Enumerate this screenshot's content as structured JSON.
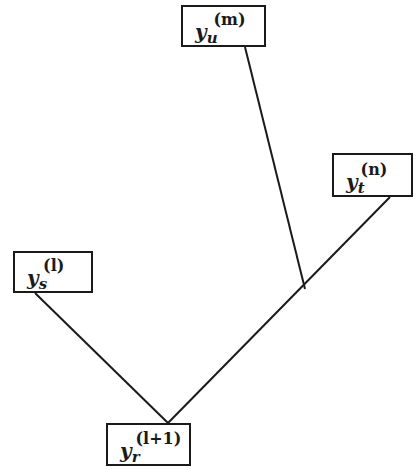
{
  "diagram": {
    "type": "tree",
    "colors": {
      "stroke": "#1a1a1a",
      "background": "#ffffff"
    },
    "nodes": [
      {
        "id": "u",
        "base": "y",
        "sub": "u",
        "sup": "(m)",
        "box": [
          181,
          5,
          85,
          42
        ]
      },
      {
        "id": "t",
        "base": "y",
        "sub": "t",
        "sup": "(n)",
        "box": [
          332,
          153,
          81,
          44
        ]
      },
      {
        "id": "s",
        "base": "y",
        "sub": "s",
        "sup": "(l)",
        "box": [
          13,
          251,
          80,
          42
        ]
      },
      {
        "id": "r",
        "base": "y",
        "sub": "r",
        "sup": "(l+1)",
        "box": [
          106,
          423,
          85,
          43
        ]
      }
    ],
    "edges": [
      {
        "from": "u",
        "to": "junction",
        "points": [
          [
            245,
            47
          ],
          [
            305,
            289
          ]
        ]
      },
      {
        "from": "t",
        "to": "r",
        "points": [
          [
            390,
            197
          ],
          [
            168,
            423
          ]
        ]
      },
      {
        "from": "s",
        "to": "r",
        "points": [
          [
            35,
            293
          ],
          [
            168,
            423
          ]
        ]
      }
    ],
    "junction": [
      305,
      289
    ]
  }
}
